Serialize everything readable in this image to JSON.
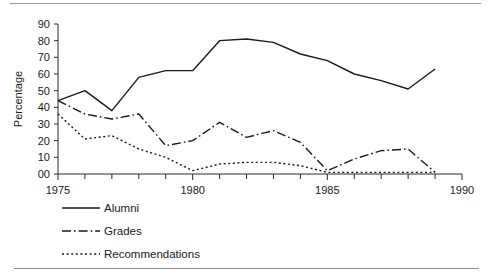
{
  "chart_data": {
    "type": "line",
    "title": "",
    "subtitle": "",
    "xlabel": "",
    "ylabel": "Percentage",
    "xlim": [
      1975,
      1990
    ],
    "ylim": [
      0,
      90
    ],
    "x_tick_labels": [
      "1975",
      "1980",
      "1985",
      "1990"
    ],
    "x_major_ticks": [
      1975,
      1980,
      1985,
      1990
    ],
    "x_minor_ticks": [
      1976,
      1977,
      1978,
      1979,
      1981,
      1982,
      1983,
      1984,
      1986,
      1987,
      1988,
      1989
    ],
    "y_tick_labels": [
      "00",
      "10",
      "20",
      "30",
      "40",
      "50",
      "60",
      "70",
      "80",
      "90"
    ],
    "y_ticks": [
      0,
      10,
      20,
      30,
      40,
      50,
      60,
      70,
      80,
      90
    ],
    "grid": false,
    "legend_position": "below-left",
    "x": [
      1975,
      1976,
      1977,
      1978,
      1979,
      1980,
      1981,
      1982,
      1983,
      1984,
      1985,
      1986,
      1987,
      1988,
      1989
    ],
    "series": [
      {
        "name": "Alumni",
        "style": "solid",
        "values": [
          44,
          50,
          38,
          58,
          62,
          62,
          80,
          81,
          79,
          72,
          68,
          60,
          56,
          51,
          63
        ]
      },
      {
        "name": "Grades",
        "style": "dash-dot",
        "values": [
          44,
          36,
          33,
          36,
          17,
          20,
          31,
          22,
          26,
          19,
          2,
          9,
          14,
          15,
          1
        ]
      },
      {
        "name": "Recommendations",
        "style": "dotted",
        "values": [
          36,
          21,
          23,
          15,
          10,
          2,
          6,
          7,
          7,
          5,
          1,
          1,
          1,
          1,
          1
        ]
      }
    ]
  },
  "legend": {
    "items": [
      {
        "label": "Alumni",
        "style": "solid"
      },
      {
        "label": "Grades",
        "style": "dash-dot"
      },
      {
        "label": "Recommendations",
        "style": "dotted"
      }
    ]
  },
  "axis": {
    "y_title": "Percentage"
  }
}
